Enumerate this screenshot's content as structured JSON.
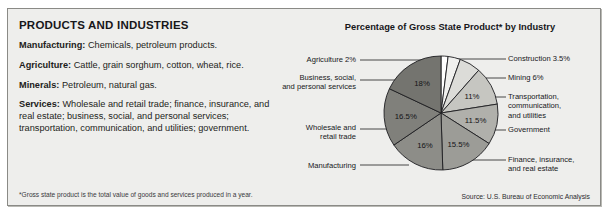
{
  "panel": {
    "left_title": "PRODUCTS AND INDUSTRIES",
    "entries": [
      {
        "term": "Manufacturing:",
        "text": " Chemicals, petroleum products."
      },
      {
        "term": "Agriculture:",
        "text": " Cattle, grain sorghum, cotton, wheat, rice."
      },
      {
        "term": "Minerals:",
        "text": " Petroleum, natural gas."
      },
      {
        "term": "Services:",
        "text": " Wholesale and retail trade; finance, insurance, and real estate; business, social, and personal services; transportation, communication, and utilities; government."
      }
    ],
    "footnote": "*Gross state product is the total value of goods and services produced in a year.",
    "source": "Source: U.S. Bureau of Economic Analysis"
  },
  "chart_data": {
    "type": "pie",
    "title": "Percentage of Gross State Product* by Industry",
    "xlabel": "",
    "ylabel": "",
    "legend_position": "callout-labels",
    "grid": false,
    "start_angle_deg": 0,
    "direction": "clockwise",
    "units": "percent",
    "categories": [
      "Agriculture",
      "Construction",
      "Mining",
      "Transportation, communication, and utilities",
      "Government",
      "Finance, insurance, and real estate",
      "Manufacturing",
      "Wholesale and retail trade",
      "Business, social, and personal services"
    ],
    "values": [
      2,
      3.5,
      6,
      11,
      11.5,
      15.5,
      16,
      16.5,
      18
    ],
    "value_labels": [
      "2%",
      "3.5%",
      "6%",
      "11%",
      "11.5%",
      "15.5%",
      "16%",
      "16.5%",
      "18%"
    ],
    "slice_colors": [
      "#ffffff",
      "#f0f0ee",
      "#dcdcd8",
      "#c6c6c1",
      "#b0b0ab",
      "#9c9c97",
      "#8d8d88",
      "#80807b",
      "#74746f"
    ],
    "labels_inside": [
      false,
      false,
      false,
      true,
      true,
      true,
      true,
      true,
      true
    ]
  },
  "callouts": {
    "agriculture": "Agriculture 2%",
    "business": "Business, social,\nand personal services",
    "wholesale": "Wholesale and\nretail trade",
    "manufacturing": "Manufacturing",
    "construction": "Construction 3.5%",
    "mining": "Mining 6%",
    "transportation": "Transportation,\ncommunication,\nand utilities",
    "government": "Government",
    "finance": "Finance, insurance,\nand real estate"
  }
}
